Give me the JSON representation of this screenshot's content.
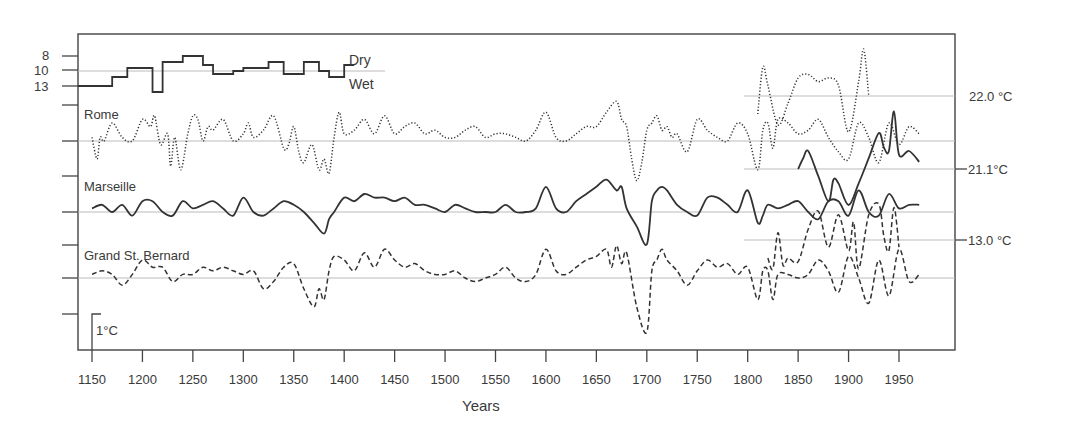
{
  "chart_data": {
    "type": "line",
    "title": "",
    "xlabel": "Years",
    "ylabel": "",
    "xlim": [
      1115,
      2005
    ],
    "x_ticks": [
      1150,
      1200,
      1250,
      1300,
      1350,
      1400,
      1450,
      1500,
      1550,
      1600,
      1650,
      1700,
      1750,
      1800,
      1850,
      1900,
      1950
    ],
    "grid": false,
    "scale_bar": {
      "label": "1°C",
      "units_per_bar": 1
    },
    "rainfall_panel": {
      "y_ticks": [
        "8",
        "10",
        "13"
      ],
      "labels": {
        "dry": "Dry",
        "wet": "Wet"
      },
      "type": "step",
      "x": [
        1150,
        1170,
        1185,
        1210,
        1220,
        1240,
        1260,
        1270,
        1290,
        1300,
        1325,
        1340,
        1360,
        1375,
        1385,
        1400
      ],
      "values": [
        13,
        11.5,
        10,
        14,
        9,
        8,
        9.5,
        11,
        10.5,
        10,
        9,
        11,
        9,
        10.5,
        11.5,
        9.5
      ]
    },
    "series": [
      {
        "name": "Rome",
        "style": "dotted",
        "baseline_label": "",
        "x": [
          1150,
          1155,
          1158,
          1162,
          1170,
          1180,
          1190,
          1200,
          1208,
          1212,
          1218,
          1225,
          1228,
          1232,
          1238,
          1245,
          1250,
          1255,
          1260,
          1265,
          1270,
          1280,
          1290,
          1300,
          1305,
          1310,
          1320,
          1330,
          1340,
          1345,
          1350,
          1355,
          1360,
          1368,
          1375,
          1380,
          1385,
          1390,
          1395,
          1400,
          1410,
          1420,
          1430,
          1440,
          1450,
          1460,
          1470,
          1480,
          1490,
          1500,
          1510,
          1520,
          1530,
          1540,
          1550,
          1560,
          1570,
          1580,
          1590,
          1600,
          1610,
          1620,
          1630,
          1640,
          1650,
          1660,
          1670,
          1675,
          1680,
          1685,
          1690,
          1695,
          1700,
          1705,
          1710,
          1715,
          1720,
          1725,
          1730,
          1740,
          1750,
          1760,
          1770,
          1780,
          1790,
          1800,
          1810,
          1815,
          1820,
          1825,
          1830,
          1840,
          1850,
          1860,
          1870,
          1880,
          1890,
          1900,
          1910,
          1920,
          1930,
          1940,
          1950,
          1960,
          1970
        ],
        "values": [
          0.1,
          -0.5,
          0.1,
          0.0,
          0.5,
          0.1,
          0.0,
          0.6,
          0.4,
          0.7,
          -0.1,
          0.2,
          -0.7,
          0.1,
          -0.8,
          0.2,
          0.7,
          0.6,
          0.0,
          0.4,
          0.3,
          0.6,
          0.0,
          0.2,
          0.5,
          0.1,
          0.3,
          0.7,
          -0.2,
          -0.1,
          0.4,
          -0.3,
          -0.6,
          -0.1,
          -0.8,
          -0.5,
          -0.9,
          0.1,
          0.8,
          0.2,
          0.3,
          0.6,
          0.2,
          0.7,
          0.2,
          0.4,
          0.5,
          0.2,
          0.3,
          0.1,
          0.1,
          0.3,
          0.4,
          0.1,
          0.2,
          0.2,
          0.1,
          0.0,
          0.3,
          0.8,
          0.1,
          0.0,
          0.2,
          0.4,
          0.4,
          0.8,
          1.1,
          0.6,
          0.4,
          -0.5,
          -1.1,
          -0.6,
          0.3,
          0.5,
          0.7,
          0.3,
          0.4,
          0.1,
          0.2,
          -0.3,
          0.6,
          0.3,
          0.1,
          0.0,
          0.5,
          0.2,
          -0.8,
          0.3,
          0.5,
          -0.2,
          0.6,
          0.5,
          0.2,
          0.3,
          0.6,
          0.1,
          -0.3,
          -0.5,
          0.5,
          0.1,
          -0.6,
          0.5,
          -0.1,
          0.4,
          0.2
        ]
      },
      {
        "name": "Rome (instrumental)",
        "style": "dotted",
        "baseline_label": "22.0 °C",
        "x": [
          1810,
          1815,
          1820,
          1830,
          1840,
          1850,
          1860,
          1870,
          1880,
          1890,
          1900,
          1910,
          1915,
          1920
        ],
        "values": [
          -0.5,
          0.8,
          0.3,
          -0.8,
          -0.2,
          0.5,
          0.6,
          0.4,
          0.5,
          0.3,
          -1.0,
          0.4,
          1.3,
          0.0
        ]
      },
      {
        "name": "Marseille",
        "style": "solid",
        "baseline_label": "",
        "x": [
          1150,
          1160,
          1170,
          1180,
          1190,
          1200,
          1210,
          1220,
          1230,
          1240,
          1250,
          1260,
          1270,
          1280,
          1290,
          1300,
          1310,
          1320,
          1330,
          1340,
          1350,
          1360,
          1370,
          1380,
          1385,
          1390,
          1400,
          1410,
          1420,
          1430,
          1440,
          1450,
          1460,
          1470,
          1480,
          1490,
          1500,
          1510,
          1520,
          1530,
          1540,
          1550,
          1560,
          1570,
          1580,
          1590,
          1600,
          1610,
          1620,
          1630,
          1640,
          1650,
          1660,
          1670,
          1675,
          1680,
          1690,
          1700,
          1705,
          1710,
          1715,
          1720,
          1730,
          1740,
          1750,
          1760,
          1770,
          1780,
          1790,
          1800,
          1810,
          1815,
          1820,
          1830,
          1840,
          1850,
          1860,
          1870,
          1880,
          1890,
          1900,
          1910,
          1920,
          1930,
          1940,
          1950,
          1960,
          1970
        ],
        "values": [
          0.1,
          0.2,
          0.0,
          0.2,
          -0.1,
          0.3,
          0.3,
          0.0,
          -0.1,
          0.3,
          0.1,
          0.2,
          0.3,
          0.1,
          -0.1,
          0.4,
          0.0,
          -0.1,
          0.1,
          0.3,
          0.2,
          0.0,
          -0.3,
          -0.6,
          -0.2,
          0.0,
          0.4,
          0.3,
          0.5,
          0.4,
          0.4,
          0.3,
          0.4,
          0.2,
          0.2,
          0.1,
          0.0,
          0.2,
          0.1,
          0.0,
          0.0,
          0.0,
          0.2,
          0.0,
          0.0,
          0.1,
          0.7,
          0.1,
          0.0,
          0.3,
          0.5,
          0.7,
          0.9,
          0.6,
          0.7,
          0.1,
          -0.4,
          -0.9,
          0.3,
          0.6,
          0.7,
          0.6,
          0.2,
          0.0,
          -0.1,
          0.4,
          0.4,
          0.2,
          0.0,
          0.6,
          -0.3,
          -0.1,
          0.2,
          0.1,
          0.2,
          0.3,
          0.0,
          -0.2,
          0.3,
          0.3,
          -0.1,
          0.6,
          0.0,
          -0.1,
          0.5,
          0.1,
          0.2,
          0.2
        ]
      },
      {
        "name": "Marseille (instrumental)",
        "style": "solid",
        "baseline_label": "21.1°C",
        "x": [
          1850,
          1855,
          1860,
          1870,
          1880,
          1885,
          1890,
          1900,
          1910,
          1920,
          1930,
          1935,
          1940,
          1945,
          1950,
          1960,
          1970
        ],
        "values": [
          0.0,
          0.3,
          0.5,
          -0.2,
          -0.9,
          -0.3,
          -0.4,
          -1.0,
          -0.4,
          0.3,
          1.0,
          0.6,
          0.5,
          1.6,
          0.4,
          0.5,
          0.2
        ]
      },
      {
        "name": "Grand St. Bernard",
        "style": "dashed",
        "baseline_label": "",
        "x": [
          1150,
          1160,
          1170,
          1180,
          1190,
          1200,
          1210,
          1220,
          1230,
          1240,
          1250,
          1260,
          1270,
          1280,
          1290,
          1300,
          1310,
          1320,
          1330,
          1340,
          1350,
          1360,
          1370,
          1375,
          1380,
          1385,
          1390,
          1400,
          1410,
          1420,
          1430,
          1440,
          1450,
          1460,
          1470,
          1480,
          1490,
          1500,
          1510,
          1520,
          1530,
          1540,
          1550,
          1560,
          1570,
          1580,
          1590,
          1600,
          1610,
          1620,
          1630,
          1640,
          1650,
          1660,
          1665,
          1670,
          1675,
          1680,
          1690,
          1700,
          1705,
          1710,
          1715,
          1720,
          1730,
          1740,
          1750,
          1760,
          1770,
          1780,
          1790,
          1800,
          1810,
          1815,
          1820,
          1825,
          1830,
          1840,
          1850,
          1860,
          1870,
          1880,
          1890,
          1900,
          1910,
          1920,
          1930,
          1940,
          1950,
          1960,
          1970
        ],
        "values": [
          0.1,
          0.2,
          0.1,
          -0.2,
          0.1,
          0.5,
          0.3,
          0.3,
          -0.1,
          0.1,
          0.1,
          0.3,
          0.2,
          0.3,
          0.2,
          0.1,
          0.2,
          -0.3,
          -0.1,
          0.3,
          0.4,
          -0.3,
          -0.8,
          -0.3,
          -0.6,
          0.2,
          0.6,
          0.5,
          0.2,
          0.7,
          0.3,
          0.8,
          0.5,
          0.3,
          0.4,
          0.2,
          0.1,
          0.1,
          0.2,
          0.0,
          -0.1,
          0.0,
          0.1,
          0.3,
          0.0,
          -0.1,
          0.1,
          0.8,
          0.2,
          0.1,
          0.3,
          0.5,
          0.6,
          0.8,
          0.3,
          0.9,
          0.4,
          0.7,
          -0.8,
          -1.5,
          0.2,
          0.5,
          0.8,
          0.5,
          0.2,
          -0.2,
          0.2,
          0.5,
          0.3,
          0.4,
          0.1,
          0.3,
          -0.6,
          0.2,
          0.2,
          -0.6,
          0.1,
          0.1,
          0.0,
          0.1,
          0.5,
          0.2,
          -0.4,
          0.6,
          0.0,
          -0.7,
          0.5,
          -0.5,
          0.8,
          -0.1,
          0.1
        ]
      },
      {
        "name": "Grand St. Bernard (instrumental)",
        "style": "dashed",
        "baseline_label": "13.0 °C",
        "x": [
          1820,
          1825,
          1830,
          1835,
          1840,
          1850,
          1860,
          1870,
          1880,
          1890,
          1900,
          1905,
          1910,
          1920,
          1930,
          1935,
          1940,
          1945,
          1950
        ],
        "values": [
          -0.5,
          -0.8,
          0.2,
          -0.7,
          -0.5,
          -0.6,
          0.3,
          0.8,
          -0.2,
          0.7,
          -0.3,
          0.5,
          -0.8,
          0.7,
          1.0,
          0.1,
          -0.3,
          0.9,
          -0.2
        ]
      }
    ]
  },
  "labels": {
    "rome": "Rome",
    "marseille": "Marseille",
    "gsb": "Grand St. Bernard",
    "dry": "Dry",
    "wet": "Wet",
    "rome_base": "22.0 °C",
    "marseille_base": "21.1°C",
    "gsb_base": "13.0 °C",
    "scale_bar": "1°C",
    "xlabel": "Years"
  }
}
